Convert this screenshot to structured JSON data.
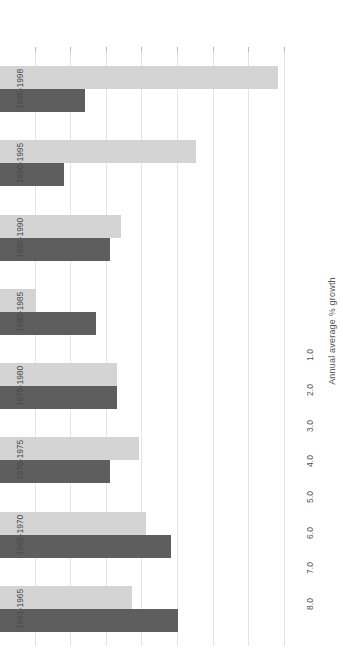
{
  "chart_data": {
    "type": "bar",
    "orientation": "horizontal",
    "title": "",
    "subtitle": "",
    "xlabel": "Annual average % growth",
    "ylabel": "",
    "categories": [
      "1961-1965",
      "1965-1970",
      "1970-1975",
      "1975-1980",
      "1980-1985",
      "1985-1990",
      "1990-1995",
      "1995-1998"
    ],
    "series": [
      {
        "name": "series-dark",
        "color": "#5e5e5e",
        "values": [
          5.0,
          4.8,
          3.1,
          3.3,
          2.7,
          3.1,
          1.8,
          2.4
        ]
      },
      {
        "name": "series-light",
        "color": "#d4d4d4",
        "values": [
          3.7,
          4.1,
          3.9,
          3.3,
          1.0,
          3.4,
          5.5,
          7.8
        ]
      }
    ],
    "axis_ticks": [
      1.0,
      2.0,
      3.0,
      4.0,
      5.0,
      6.0,
      7.0,
      8.0
    ],
    "axis_tick_labels": [
      "1.0",
      "2.0",
      "3.0",
      "4.0",
      "5.0",
      "6.0",
      "7.0",
      "8.0"
    ],
    "xlim": [
      0,
      8.4
    ],
    "grid": true,
    "legend": false,
    "legend_position": "none",
    "rotation": "180deg"
  },
  "colors": {
    "dark_series": "#5e5e5e",
    "light_series": "#d4d4d4",
    "gridline": "#e4e4e4",
    "text": "#555555",
    "background": "#ffffff"
  }
}
